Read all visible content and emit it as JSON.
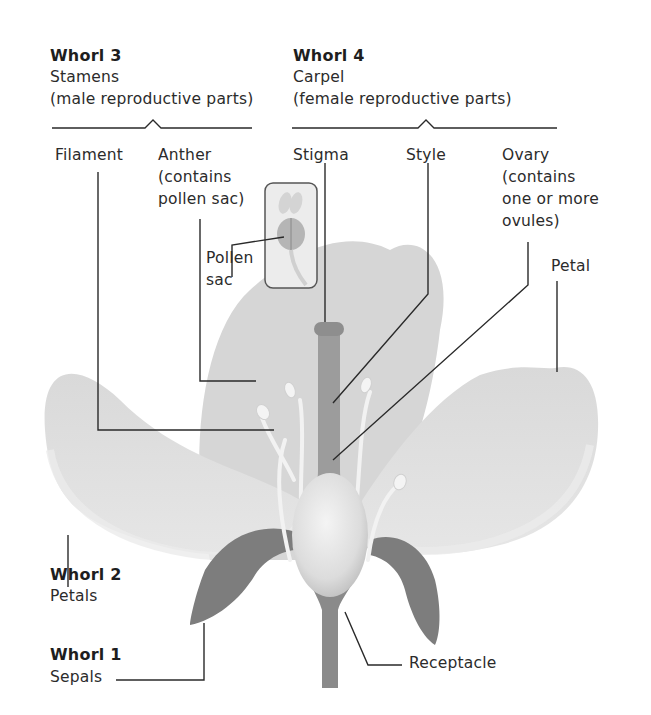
{
  "groups": {
    "whorl3": {
      "heading": "Whorl 3",
      "name": "Stamens",
      "description": "(male reproductive parts)"
    },
    "whorl4": {
      "heading": "Whorl 4",
      "name": "Carpel",
      "description": "(female reproductive parts)"
    },
    "whorl2": {
      "heading": "Whorl 2",
      "name": "Petals"
    },
    "whorl1": {
      "heading": "Whorl 1",
      "name": "Sepals"
    }
  },
  "labels": {
    "filament": "Filament",
    "anther": [
      "Anther",
      "(contains",
      "pollen sac)"
    ],
    "pollen_sac": [
      "Pollen",
      "sac"
    ],
    "stigma": "Stigma",
    "style": "Style",
    "ovary": [
      "Ovary",
      "(contains",
      "one or more",
      "ovules)"
    ],
    "petal": "Petal",
    "receptacle": "Receptacle"
  },
  "colors": {
    "background": "#ffffff",
    "petal": "#dedede",
    "petal_back": "#d2d2d2",
    "sepal": "#7a7a7a",
    "pistil": "#9a9a9a",
    "ovary": "#e6e6e6",
    "leader_line": "#2a2a2a"
  }
}
